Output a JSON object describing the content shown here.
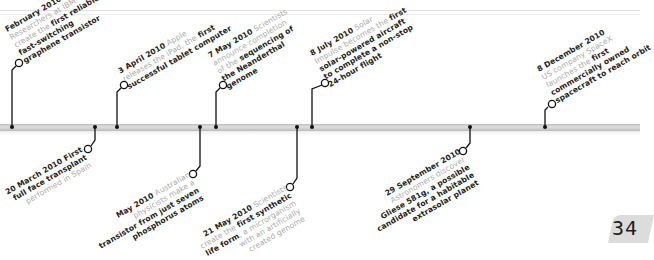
{
  "page": {
    "number": "34"
  },
  "colors": {
    "bar": "#c8c8c8",
    "text_bold": "#222222",
    "text_light": "#aaaaaa",
    "page_tab": "#dcdcdc"
  },
  "events_top": [
    {
      "id": "feb",
      "lines": [
        [
          {
            "t": "February 2010",
            "s": "date"
          }
        ],
        [
          {
            "t": "Researchers at IBM",
            "s": "n"
          }
        ],
        [
          {
            "t": "create the ",
            "s": "n"
          },
          {
            "t": "first reliable",
            "s": "b"
          }
        ],
        [
          {
            "t": "fast-switching",
            "s": "b"
          }
        ],
        [
          {
            "t": "graphene transistor",
            "s": "b"
          }
        ]
      ]
    },
    {
      "id": "apr",
      "lines": [
        [
          {
            "t": "3 April 2010",
            "s": "date"
          },
          {
            "t": " Apple",
            "s": "n"
          }
        ],
        [
          {
            "t": "releases the iPad, the ",
            "s": "n"
          },
          {
            "t": "first",
            "s": "b"
          }
        ],
        [
          {
            "t": "successful tablet computer",
            "s": "b"
          }
        ]
      ]
    },
    {
      "id": "may7",
      "lines": [
        [
          {
            "t": "7 May 2010",
            "s": "date"
          },
          {
            "t": " Scientists",
            "s": "n"
          }
        ],
        [
          {
            "t": "announce completion",
            "s": "n"
          }
        ],
        [
          {
            "t": "of the ",
            "s": "n"
          },
          {
            "t": "sequencing of",
            "s": "b"
          }
        ],
        [
          {
            "t": "the Neanderthal",
            "s": "b"
          }
        ],
        [
          {
            "t": "genome",
            "s": "b"
          }
        ]
      ]
    },
    {
      "id": "jul",
      "lines": [
        [
          {
            "t": "8 July 2010",
            "s": "date"
          },
          {
            "t": " Solar",
            "s": "n"
          }
        ],
        [
          {
            "t": "Impulse becomes the ",
            "s": "n"
          },
          {
            "t": "first",
            "s": "b"
          }
        ],
        [
          {
            "t": "solar-powered aircraft",
            "s": "b"
          }
        ],
        [
          {
            "t": "to complete a non-stop",
            "s": "b"
          }
        ],
        [
          {
            "t": "24-hour flight",
            "s": "b"
          }
        ]
      ]
    },
    {
      "id": "dec",
      "lines": [
        [
          {
            "t": "8 December 2010",
            "s": "date"
          }
        ],
        [
          {
            "t": "US company SpaceX",
            "s": "n"
          }
        ],
        [
          {
            "t": "launches the ",
            "s": "n"
          },
          {
            "t": "first",
            "s": "b"
          }
        ],
        [
          {
            "t": "commercially owned",
            "s": "b"
          }
        ],
        [
          {
            "t": "spacecraft to reach orbit",
            "s": "b"
          }
        ]
      ]
    }
  ],
  "events_bottom": [
    {
      "id": "mar",
      "lines": [
        [
          {
            "t": "20 March 2010",
            "s": "date"
          },
          {
            "t": " First",
            "s": "b"
          }
        ],
        [
          {
            "t": "full face transplant",
            "s": "b"
          }
        ],
        [
          {
            "t": "performed in Spain",
            "s": "n"
          }
        ]
      ]
    },
    {
      "id": "mayaus",
      "lines": [
        [
          {
            "t": "May 2010",
            "s": "date"
          },
          {
            "t": " Australian",
            "s": "n"
          }
        ],
        [
          {
            "t": "physicists make a",
            "s": "n"
          }
        ],
        [
          {
            "t": "transistor from just seven",
            "s": "b"
          }
        ],
        [
          {
            "t": "phosphorus atoms",
            "s": "b"
          }
        ]
      ]
    },
    {
      "id": "may21",
      "lines": [
        [
          {
            "t": "21 May 2010",
            "s": "date"
          },
          {
            "t": " Scientists",
            "s": "n"
          }
        ],
        [
          {
            "t": "create the ",
            "s": "n"
          },
          {
            "t": "first synthetic",
            "s": "b"
          }
        ],
        [
          {
            "t": "life form",
            "s": "b"
          },
          {
            "t": ", a microrganism",
            "s": "n"
          }
        ],
        [
          {
            "t": "with an artificially",
            "s": "n"
          }
        ],
        [
          {
            "t": "created genome",
            "s": "n"
          }
        ]
      ]
    },
    {
      "id": "sep",
      "lines": [
        [
          {
            "t": "29 September 2010",
            "s": "date"
          }
        ],
        [
          {
            "t": "Astronomers discover",
            "s": "n"
          }
        ],
        [
          {
            "t": "Gliese 581g, a possible",
            "s": "b"
          }
        ],
        [
          {
            "t": "candidate for a habitable",
            "s": "b"
          }
        ],
        [
          {
            "t": "extrasolar planet",
            "s": "b"
          }
        ]
      ]
    }
  ]
}
